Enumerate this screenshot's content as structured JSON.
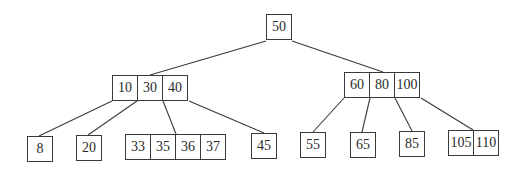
{
  "diagram": {
    "type": "B-tree",
    "root": {
      "id": "root",
      "keys": [
        "50"
      ],
      "pos": {
        "x": 266,
        "y": 14
      }
    },
    "level1": [
      {
        "id": "l1-left",
        "keys": [
          "10",
          "30",
          "40"
        ],
        "pos": {
          "x": 112,
          "y": 75
        }
      },
      {
        "id": "l1-right",
        "keys": [
          "60",
          "80",
          "100"
        ],
        "pos": {
          "x": 344,
          "y": 72
        }
      }
    ],
    "leaves": [
      {
        "id": "leaf-8",
        "keys": [
          "8"
        ],
        "pos": {
          "x": 27,
          "y": 136
        }
      },
      {
        "id": "leaf-20",
        "keys": [
          "20"
        ],
        "pos": {
          "x": 76,
          "y": 135
        }
      },
      {
        "id": "leaf-33-37",
        "keys": [
          "33",
          "35",
          "36",
          "37"
        ],
        "pos": {
          "x": 125,
          "y": 134
        }
      },
      {
        "id": "leaf-45",
        "keys": [
          "45"
        ],
        "pos": {
          "x": 251,
          "y": 133
        }
      },
      {
        "id": "leaf-55",
        "keys": [
          "55"
        ],
        "pos": {
          "x": 300,
          "y": 132
        }
      },
      {
        "id": "leaf-65",
        "keys": [
          "65"
        ],
        "pos": {
          "x": 350,
          "y": 132
        }
      },
      {
        "id": "leaf-85",
        "keys": [
          "85"
        ],
        "pos": {
          "x": 399,
          "y": 131
        }
      },
      {
        "id": "leaf-105-110",
        "keys": [
          "105",
          "110"
        ],
        "pos": {
          "x": 448,
          "y": 130
        }
      }
    ],
    "edges": [
      {
        "from": "root",
        "to": "l1-left",
        "x1": 266,
        "y1": 41,
        "x2": 150,
        "y2": 75
      },
      {
        "from": "root",
        "to": "l1-right",
        "x1": 292,
        "y1": 41,
        "x2": 383,
        "y2": 72
      },
      {
        "from": "l1-left",
        "to": "leaf-8",
        "x1": 112,
        "y1": 101,
        "x2": 39,
        "y2": 136
      },
      {
        "from": "l1-left",
        "to": "leaf-20",
        "x1": 137,
        "y1": 101,
        "x2": 88,
        "y2": 135
      },
      {
        "from": "l1-left",
        "to": "leaf-33-37",
        "x1": 163,
        "y1": 101,
        "x2": 176,
        "y2": 134
      },
      {
        "from": "l1-left",
        "to": "leaf-45",
        "x1": 189,
        "y1": 101,
        "x2": 264,
        "y2": 133
      },
      {
        "from": "l1-right",
        "to": "leaf-55",
        "x1": 344,
        "y1": 98,
        "x2": 313,
        "y2": 132
      },
      {
        "from": "l1-right",
        "to": "leaf-65",
        "x1": 370,
        "y1": 98,
        "x2": 362,
        "y2": 132
      },
      {
        "from": "l1-right",
        "to": "leaf-85",
        "x1": 395,
        "y1": 98,
        "x2": 412,
        "y2": 131
      },
      {
        "from": "l1-right",
        "to": "leaf-105-110",
        "x1": 421,
        "y1": 98,
        "x2": 473,
        "y2": 130
      }
    ],
    "colors": {
      "stroke": "#3a3a3a",
      "text": "#2a2a2a",
      "background": "#ffffff"
    }
  }
}
